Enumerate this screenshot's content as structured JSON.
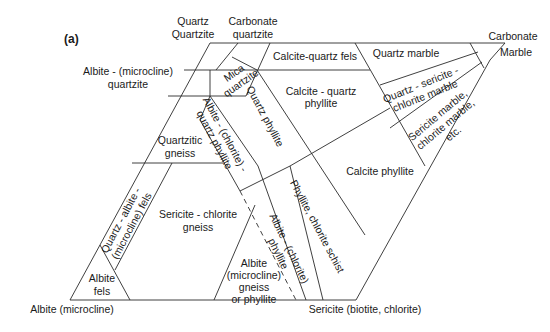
{
  "figure": {
    "panel_label": "(a)",
    "type": "ternary-like classification diagram of metamorphic rock names"
  },
  "corners": {
    "top_left": [
      "Quartz",
      "Quartzite"
    ],
    "top_middle": [
      "Carbonate",
      "quartzite"
    ],
    "top_right": [
      "Carbonate",
      "Marble"
    ],
    "bottom_left": "Albite (microcline)",
    "bottom_right": "Sericite (biotite, chlorite)",
    "left_side": [
      "Albite - (microcline)",
      "quartzite"
    ]
  },
  "fields": {
    "mica_quartzite": [
      "Mica",
      "quartzite"
    ],
    "calcite_quartz_fels": "Calcite-quartz fels",
    "quartz_marble": "Quartz marble",
    "calcite_quartz_phyllite": [
      "Calcite - quartz",
      "phyllite"
    ],
    "quartz_sericite_chlorite_marble": [
      "Quartz - sericite -",
      "chlorite marble"
    ],
    "sericite_chlorite_marble": [
      "Sericite marble,",
      "chlorite marble,",
      "etc."
    ],
    "quartzitic_gneiss": [
      "Quartzitic",
      "gneiss"
    ],
    "albite_chlorite_quartz_phyllite": [
      "Albite - (chlorite) -",
      "quartz phyllite"
    ],
    "quartz_phyllite": "Quartz phyllite",
    "calcite_phyllite": "Calcite phyllite",
    "quartz_albite_microcline_fels": [
      "Quartz - albite -",
      "(microcline) fels"
    ],
    "sericite_chlorite_gneiss": [
      "Sericite - chlorite",
      "gneiss"
    ],
    "phyllite_chlorite_schist": "Phyllite, chlorite schist",
    "albite_chlorite_phyllite": [
      "Albite - (chlorite)",
      "phyllite"
    ],
    "albite_fels": [
      "Albite",
      "fels"
    ],
    "albite_microcline_gneiss_or_phyllite": [
      "Albite",
      "(microcline)",
      "gneiss",
      "or phyllite"
    ]
  }
}
